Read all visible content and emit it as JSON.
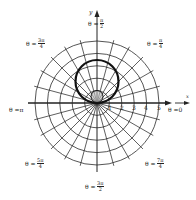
{
  "diagram": {
    "type": "polar-graph",
    "origin": {
      "x": 97,
      "y": 103
    },
    "unit_px": 12.4,
    "rings": [
      1,
      2,
      3,
      4,
      5
    ],
    "radial_step_deg": 15,
    "line_color": "#2a2a2a",
    "curve_color": "#111111",
    "curves": [
      {
        "name": "large-circle",
        "center_x": 97,
        "center_y": 81.5,
        "radius_px": 21.5,
        "stroke": 2.2
      },
      {
        "name": "small-circle",
        "center_x": 97,
        "center_y": 96.5,
        "radius_px": 6,
        "stroke": 1,
        "fill": "#bbbbbb"
      }
    ]
  },
  "axes": {
    "x_label": "x",
    "y_label": "y",
    "x_ticks": [
      "1",
      "2",
      "3",
      "4",
      "5"
    ]
  },
  "angle_labels": {
    "theta_0": {
      "prefix": "θ = ",
      "value": "0"
    },
    "theta_pi": {
      "prefix": "θ = ",
      "value": "π"
    },
    "theta_pi_2": {
      "prefix": "θ = ",
      "num": "π",
      "den": "2"
    },
    "theta_pi_4": {
      "prefix": "θ = ",
      "num": "π",
      "den": "4"
    },
    "theta_3pi_4": {
      "prefix": "θ = ",
      "num": "3π",
      "den": "4"
    },
    "theta_5pi_4": {
      "prefix": "θ = ",
      "num": "5π",
      "den": "4"
    },
    "theta_3pi_2": {
      "prefix": "θ = ",
      "num": "3π",
      "den": "2"
    },
    "theta_7pi_4": {
      "prefix": "θ = ",
      "num": "7π",
      "den": "4"
    }
  }
}
